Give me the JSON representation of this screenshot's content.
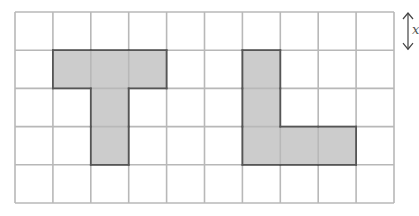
{
  "grid": {
    "cols": 10,
    "rows": 5,
    "left": 15,
    "top": 12,
    "cell_w": 37.9,
    "cell_h": 38.2,
    "line_color": "#b8b8b8",
    "fill_color": "#cccccc",
    "outline_color": "#555555"
  },
  "shapes": [
    {
      "name": "T-shape",
      "cells": [
        [
          1,
          1
        ],
        [
          2,
          1
        ],
        [
          3,
          1
        ],
        [
          2,
          2
        ],
        [
          2,
          3
        ]
      ]
    },
    {
      "name": "L-shape",
      "cells": [
        [
          6,
          1
        ],
        [
          6,
          2
        ],
        [
          6,
          3
        ],
        [
          7,
          3
        ],
        [
          8,
          3
        ]
      ]
    }
  ],
  "dimension": {
    "label": "x",
    "arrow": "vertical-double-arrow"
  }
}
